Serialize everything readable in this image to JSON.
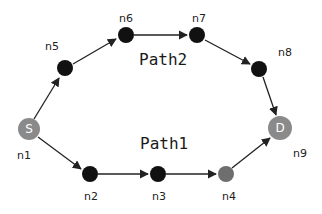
{
  "diagram": {
    "type": "network-graph",
    "colors": {
      "regular_node": "#111111",
      "endpoint_node": "#8a8a8a",
      "n4_node": "#6e6e6e",
      "edge": "#222222"
    },
    "path_labels": {
      "path1": "Path1",
      "path2": "Path2"
    },
    "nodes": [
      {
        "id": "n1",
        "label": "n1",
        "inner": "S",
        "role": "source"
      },
      {
        "id": "n2",
        "label": "n2"
      },
      {
        "id": "n3",
        "label": "n3"
      },
      {
        "id": "n4",
        "label": "n4"
      },
      {
        "id": "n5",
        "label": "n5"
      },
      {
        "id": "n6",
        "label": "n6"
      },
      {
        "id": "n7",
        "label": "n7"
      },
      {
        "id": "n8",
        "label": "n8"
      },
      {
        "id": "n9",
        "label": "n9",
        "inner": "D",
        "role": "destination"
      }
    ],
    "edges": [
      {
        "from": "n1",
        "to": "n5",
        "path": "Path2"
      },
      {
        "from": "n5",
        "to": "n6",
        "path": "Path2"
      },
      {
        "from": "n6",
        "to": "n7",
        "path": "Path2"
      },
      {
        "from": "n7",
        "to": "n8",
        "path": "Path2"
      },
      {
        "from": "n8",
        "to": "n9",
        "path": "Path2"
      },
      {
        "from": "n1",
        "to": "n2",
        "path": "Path1"
      },
      {
        "from": "n2",
        "to": "n3",
        "path": "Path1"
      },
      {
        "from": "n3",
        "to": "n4",
        "path": "Path1"
      },
      {
        "from": "n4",
        "to": "n9",
        "path": "Path1"
      }
    ]
  }
}
